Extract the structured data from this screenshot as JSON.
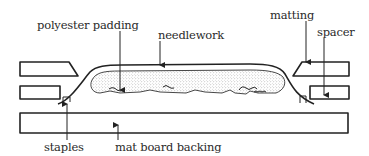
{
  "diagram": {
    "type": "cross-section",
    "labels": {
      "polyester_padding": "polyester padding",
      "needlework": "needlework",
      "matting": "matting",
      "spacer": "spacer",
      "staples": "staples",
      "mat_board_backing": "mat board backing"
    },
    "components": [
      {
        "id": "matting-left",
        "label": "matting",
        "shape": "parallelogram"
      },
      {
        "id": "matting-right",
        "label": "matting",
        "shape": "parallelogram"
      },
      {
        "id": "spacer-left",
        "label": "spacer",
        "shape": "rectangle"
      },
      {
        "id": "spacer-right",
        "label": "spacer",
        "shape": "rectangle"
      },
      {
        "id": "mat-board-backing",
        "label": "mat board backing",
        "shape": "rectangle"
      },
      {
        "id": "needlework",
        "label": "needlework",
        "shape": "curved fabric over padding"
      },
      {
        "id": "polyester-padding",
        "label": "polyester padding",
        "shape": "stippled mound"
      },
      {
        "id": "staple-left",
        "label": "staples",
        "shape": "small bracket"
      },
      {
        "id": "staple-right",
        "label": "staples",
        "shape": "small bracket"
      }
    ],
    "colors": {
      "line": "#222222",
      "text": "#2a2a2a",
      "background": "#ffffff",
      "stipple": "#9a9a9a"
    }
  }
}
